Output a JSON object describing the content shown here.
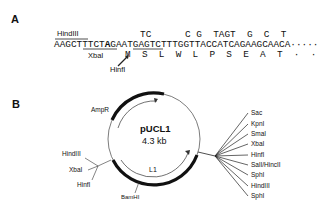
{
  "panel_a": {
    "label": "A",
    "site_labels": {
      "hindiii": "HindIII",
      "xbai": "XbaI",
      "hinfi": "HinfI"
    },
    "mutations_line": "TC      C G  TAGT  G  C  T",
    "sequence_pre": "AAGCTTTCT",
    "sequence_bold": "A",
    "sequence_post": "GAATGAGTCTTTGGTTACCATCAGAAGCAACA",
    "sequence_dots": "·····",
    "translation": "M  S  L  W  L  P  S  E  A  T  ·  ·"
  },
  "panel_b": {
    "label": "B",
    "plasmid_name": "pUCL1",
    "plasmid_size": "4.3 kb",
    "features": {
      "ampr": "AmpR",
      "l1": "L1",
      "bamhi": "BamHI"
    },
    "left_sites": [
      "HindIII",
      "XbaI",
      "HinfI"
    ],
    "right_mcs_sites": [
      "Sac",
      "KpnI",
      "SmaI",
      "XbaI",
      "HinfI",
      "SalI/HincII",
      "SphI",
      "HindIII",
      "SphI"
    ]
  }
}
